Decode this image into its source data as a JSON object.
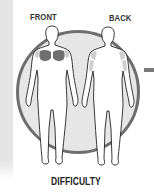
{
  "labels": {
    "front": "FRONT",
    "back": "BACK",
    "difficulty": "DIFFICULTY"
  },
  "colors": {
    "circle_fill": "#e6e6e6",
    "circle_border": "#6e6e6e",
    "muscle_primary": "#6f6f6f",
    "muscle_secondary": "#cfcfcf",
    "side_panel": "#e4e4e4"
  },
  "highlighted_muscles": {
    "front": [
      "chest (pectorals)",
      "front shoulders"
    ],
    "back": [
      "rear shoulders",
      "triceps"
    ]
  }
}
